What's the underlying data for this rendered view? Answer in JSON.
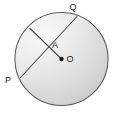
{
  "figure": {
    "name": "circle-with-chord-and-radius",
    "background_color": "#ffffff",
    "stroke_color": "#4a4a4a",
    "label_color": "#1c1c1c",
    "fill_light": "#f2f2f2",
    "fill_mid": "#d8d8d8",
    "fill_dark": "#bfbfbf",
    "circle": {
      "center_x": 61.5,
      "center_y": 59,
      "radius": 46.5,
      "center_label": "O",
      "center_dot_radius": 2.1
    },
    "points": [
      {
        "id": "Q",
        "label": "Q",
        "x": 77,
        "y": 16.5,
        "label_x": 75,
        "label_y": 9
      },
      {
        "id": "P",
        "label": "P",
        "x": 20.5,
        "y": 77.5,
        "label_x": 5,
        "label_y": 81
      },
      {
        "id": "A",
        "label": "A",
        "x": 48.5,
        "y": 41,
        "label_x": 52,
        "label_y": 49
      },
      {
        "id": "O",
        "label": "O",
        "x": 61.5,
        "y": 59,
        "label_x": 70,
        "label_y": 63
      },
      {
        "id": "R",
        "label": "",
        "x": 30,
        "y": 28.5,
        "label_x": 0,
        "label_y": 0
      }
    ],
    "segments": [
      {
        "id": "chord-PQ",
        "from": "P",
        "to": "Q"
      },
      {
        "id": "segment-R-to-O",
        "from": "R",
        "to": "O"
      }
    ],
    "labels": {
      "Q": "Q",
      "P": "P",
      "A": "A",
      "O": "O"
    }
  }
}
